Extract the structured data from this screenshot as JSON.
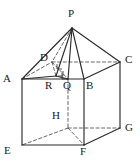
{
  "figure": {
    "stroke_color": "#2b2b2b",
    "dashed_color": "#555555",
    "background": "#ffffff",
    "width": 140,
    "height": 162
  },
  "vertices": [
    {
      "id": "P",
      "label": "P",
      "x": 72,
      "y": 28,
      "label_x": 68,
      "label_y": 8,
      "kind": "apex"
    },
    {
      "id": "A",
      "label": "A",
      "x": 22,
      "y": 79,
      "label_x": 3,
      "label_y": 73,
      "kind": "top-front-left"
    },
    {
      "id": "B",
      "label": "B",
      "x": 84,
      "y": 79,
      "label_x": 86,
      "label_y": 80,
      "kind": "top-front-right"
    },
    {
      "id": "C",
      "label": "C",
      "x": 120,
      "y": 62,
      "label_x": 125,
      "label_y": 54,
      "kind": "top-back-right"
    },
    {
      "id": "D",
      "label": "D",
      "x": 52,
      "y": 62,
      "label_x": 40,
      "label_y": 52,
      "kind": "top-back-left"
    },
    {
      "id": "E",
      "label": "E",
      "x": 22,
      "y": 145,
      "label_x": 4,
      "label_y": 145,
      "kind": "bottom-front-left"
    },
    {
      "id": "F",
      "label": "F",
      "x": 84,
      "y": 145,
      "label_x": 80,
      "label_y": 146,
      "kind": "bottom-front-right"
    },
    {
      "id": "G",
      "label": "G",
      "x": 120,
      "y": 128,
      "label_x": 125,
      "label_y": 122,
      "kind": "bottom-back-right"
    },
    {
      "id": "H",
      "label": "H",
      "x": 68,
      "y": 128,
      "label_x": 52,
      "label_y": 110,
      "kind": "bottom-back-left"
    },
    {
      "id": "Q",
      "label": "Q",
      "x": 68,
      "y": 79,
      "label_x": 63,
      "label_y": 80,
      "kind": "interior-point"
    },
    {
      "id": "R",
      "label": "R",
      "x": 56,
      "y": 76,
      "label_x": 45,
      "label_y": 80,
      "kind": "interior-point"
    }
  ],
  "edges": {
    "solid": [
      {
        "name": "edge-P-A",
        "from": "P",
        "to": "A"
      },
      {
        "name": "edge-P-B",
        "from": "P",
        "to": "B"
      },
      {
        "name": "edge-P-C",
        "from": "P",
        "to": "C"
      },
      {
        "name": "edge-A-B",
        "from": "A",
        "to": "B"
      },
      {
        "name": "edge-B-C",
        "from": "B",
        "to": "C"
      },
      {
        "name": "edge-A-E",
        "from": "A",
        "to": "E"
      },
      {
        "name": "edge-B-F",
        "from": "B",
        "to": "F"
      },
      {
        "name": "edge-C-G",
        "from": "C",
        "to": "G"
      },
      {
        "name": "edge-E-F",
        "from": "E",
        "to": "F"
      },
      {
        "name": "edge-F-G",
        "from": "F",
        "to": "G"
      },
      {
        "name": "edge-P-R",
        "from": "P",
        "to": "R"
      },
      {
        "name": "edge-P-Q",
        "from": "P",
        "to": "Q"
      },
      {
        "name": "edge-A-R",
        "from": "A",
        "to": "R"
      },
      {
        "name": "edge-R-Q",
        "from": "R",
        "to": "Q"
      }
    ],
    "dashed": [
      {
        "name": "edge-P-D",
        "from": "P",
        "to": "D"
      },
      {
        "name": "edge-A-D",
        "from": "A",
        "to": "D"
      },
      {
        "name": "edge-D-C",
        "from": "D",
        "to": "C"
      },
      {
        "name": "edge-D-Q",
        "from": "D",
        "to": "Q"
      },
      {
        "name": "edge-D-R",
        "from": "D",
        "to": "R"
      },
      {
        "name": "edge-Q-H",
        "from": "Q",
        "to": "H"
      },
      {
        "name": "edge-H-E",
        "from": "H",
        "to": "E"
      },
      {
        "name": "edge-H-G",
        "from": "H",
        "to": "G"
      },
      {
        "name": "edge-H-F",
        "from": "H",
        "to": "F"
      }
    ]
  },
  "right_angle_marks": [
    {
      "name": "right-angle-at-Q",
      "x": 68,
      "y": 73,
      "size": 6,
      "dir": "left-down"
    },
    {
      "name": "right-angle-at-R",
      "x": 58,
      "y": 71,
      "size": 5,
      "dir": "right-down"
    },
    {
      "name": "right-angle-near-D",
      "x": 62,
      "y": 64,
      "size": 5,
      "dir": "left-down"
    }
  ]
}
